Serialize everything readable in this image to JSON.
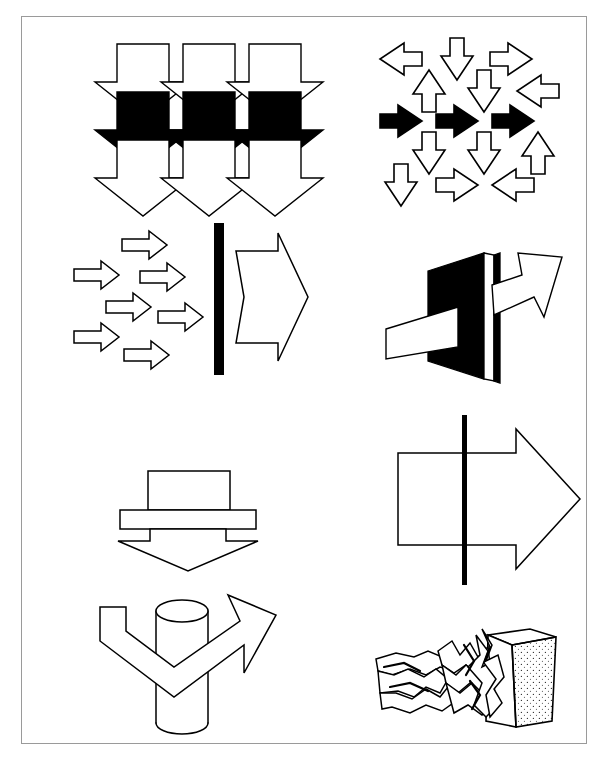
{
  "page": {
    "width": 608,
    "height": 767,
    "background_color": "#ffffff",
    "caption_text": "",
    "frame": {
      "border_color": "#9a9a9a",
      "fill_color": "#ffffff"
    }
  },
  "palette": {
    "ink": "#000000",
    "paper": "#ffffff",
    "frame_border": "#9a9a9a",
    "stipple": "#555555"
  },
  "figures": [
    {
      "id": "fig-1",
      "name": "tessellated-down-arrows-grid",
      "title": "Interlocking downward arrows, three rows",
      "rows": 3,
      "columns": 3,
      "arrow_direction": "down",
      "row_fills": [
        "white",
        "black",
        "white"
      ],
      "stroke_color": "#000000",
      "black_row_index": 1
    },
    {
      "id": "fig-2",
      "name": "multidirectional-arrow-tessellation",
      "title": "Tessellation of arrows in many directions with a black rightward row",
      "black_arrow_count": 3,
      "black_arrow_direction": "right",
      "white_arrow_directions": [
        "left",
        "down",
        "right",
        "up",
        "down",
        "left",
        "up",
        "down",
        "right",
        "up",
        "left",
        "down",
        "right",
        "down",
        "left"
      ],
      "stroke_color": "#000000",
      "fill_color": "#ffffff"
    },
    {
      "id": "fig-3",
      "name": "many-small-arrows-into-barrier-one-large-arrow",
      "title": "Six small arrows converge on a black barrier, one large arrow exits",
      "small_arrow_count": 6,
      "small_arrow_direction": "right",
      "barrier_color": "#000000",
      "barrier_orientation": "vertical",
      "large_arrow_direction": "right",
      "large_arrow_fill": "white"
    },
    {
      "id": "fig-4",
      "name": "arrow-piercing-black-slab",
      "title": "White arrow penetrating a black three-dimensional slab",
      "slab_color": "#000000",
      "arrow_fill": "#ffffff",
      "arrow_direction": "up-right",
      "perspective": "3d"
    },
    {
      "id": "fig-5",
      "name": "block-on-bar-with-down-arrow",
      "title": "Rectangular block resting on a bar forming a downward arrow",
      "arrow_direction": "down",
      "fill": "white",
      "stroke_color": "#000000",
      "parts": [
        "block",
        "bar",
        "arrowhead"
      ]
    },
    {
      "id": "fig-6",
      "name": "large-right-arrow-crossed-by-line",
      "title": "Large outline arrow crossed by a thin black vertical line",
      "arrow_direction": "right",
      "arrow_fill": "white",
      "line_color": "#000000",
      "line_orientation": "vertical"
    },
    {
      "id": "fig-7",
      "name": "cylinder-with-wrapping-arrow",
      "title": "Cylinder wrapped by a V-shaped arrow turning upward to the right",
      "cylinder_fill": "white",
      "arrow_fill": "white",
      "arrow_direction": "up-right",
      "stroke_color": "#000000"
    },
    {
      "id": "fig-8",
      "name": "crumpled-arrow-against-wall",
      "title": "Crumpled arrow crashed against a stippled solid block",
      "arrow_state": "crumpled",
      "wall_fill": "#ffffff",
      "wall_texture": "stipple",
      "stroke_color": "#000000"
    }
  ]
}
